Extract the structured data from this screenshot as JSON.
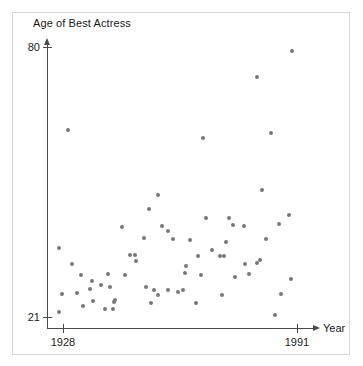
{
  "chart_data": {
    "type": "scatter",
    "title": "Age of Best Actress",
    "xlabel": "Year",
    "ylabel": "Age of Best Actress",
    "xlim": [
      1928,
      1991
    ],
    "ylim": [
      21,
      80
    ],
    "xticks": [
      1928,
      1991
    ],
    "yticks": [
      21,
      80
    ],
    "xtick_labels": [
      "1928",
      "1991"
    ],
    "ytick_labels": [
      "21",
      "80"
    ],
    "grid": false,
    "legend": null,
    "point_color": "#78787a",
    "axis_color": "#4a4a4a",
    "series": [
      {
        "name": "Best Actress age by year",
        "points": [
          [
            1929,
            62
          ],
          [
            1930,
            36
          ],
          [
            1931,
            31
          ],
          [
            1932,
            39
          ],
          [
            1933,
            22
          ],
          [
            1934,
            28
          ],
          [
            1935,
            34
          ],
          [
            1936,
            33
          ],
          [
            1937,
            30
          ],
          [
            1938,
            26
          ],
          [
            1939,
            26
          ],
          [
            1940,
            29
          ],
          [
            1941,
            32
          ],
          [
            1942,
            30
          ],
          [
            1943,
            25
          ],
          [
            1944,
            25
          ],
          [
            1945,
            36
          ],
          [
            1946,
            31
          ],
          [
            1947,
            33
          ],
          [
            1948,
            38
          ],
          [
            1949,
            28
          ],
          [
            1950,
            34
          ],
          [
            1951,
            34
          ],
          [
            1952,
            28
          ],
          [
            1953,
            24
          ],
          [
            1954,
            47
          ],
          [
            1955,
            43
          ],
          [
            1956,
            35
          ],
          [
            1957,
            52
          ],
          [
            1958,
            31
          ],
          [
            1959,
            33
          ],
          [
            1960,
            30
          ],
          [
            1961,
            41
          ],
          [
            1962,
            40
          ],
          [
            1963,
            33
          ],
          [
            1964,
            31
          ],
          [
            1965,
            25
          ],
          [
            1966,
            35
          ],
          [
            1967,
            42
          ],
          [
            1968,
            34
          ],
          [
            1969,
            34
          ],
          [
            1970,
            34
          ],
          [
            1971,
            33
          ],
          [
            1972,
            45
          ],
          [
            1973,
            25
          ],
          [
            1974,
            36
          ],
          [
            1975,
            35
          ],
          [
            1976,
            35
          ],
          [
            1977,
            30
          ],
          [
            1978,
            62
          ],
          [
            1979,
            41
          ],
          [
            1980,
            44
          ],
          [
            1981,
            43
          ],
          [
            1982,
            39
          ],
          [
            1983,
            34
          ],
          [
            1984,
            37
          ],
          [
            1985,
            35
          ],
          [
            1986,
            38
          ],
          [
            1987,
            33
          ],
          [
            1988,
            50
          ],
          [
            1989,
            29
          ],
          [
            1990,
            76
          ],
          [
            1991,
            80
          ],
          [
            1992,
            62
          ],
          [
            1993,
            38
          ],
          [
            1994,
            30
          ],
          [
            1995,
            22
          ],
          [
            1996,
            43
          ],
          [
            1997,
            41
          ],
          [
            1998,
            35
          ],
          [
            1999,
            33
          ]
        ]
      }
    ],
    "pixel_points": [
      [
        68,
        130
      ],
      [
        59,
        248
      ],
      [
        72,
        264
      ],
      [
        59,
        312
      ],
      [
        81,
        275
      ],
      [
        92,
        281
      ],
      [
        62,
        294
      ],
      [
        77,
        293
      ],
      [
        90,
        289
      ],
      [
        93,
        301
      ],
      [
        83,
        306
      ],
      [
        101,
        285
      ],
      [
        108,
        274
      ],
      [
        110,
        287
      ],
      [
        115,
        300
      ],
      [
        105,
        309
      ],
      [
        113,
        309
      ],
      [
        114,
        302
      ],
      [
        122,
        227
      ],
      [
        125,
        275
      ],
      [
        130,
        255
      ],
      [
        135,
        255
      ],
      [
        136,
        261
      ],
      [
        144,
        238
      ],
      [
        146,
        287
      ],
      [
        149,
        209
      ],
      [
        151,
        303
      ],
      [
        154,
        290
      ],
      [
        158,
        195
      ],
      [
        158,
        295
      ],
      [
        162,
        226
      ],
      [
        168,
        231
      ],
      [
        168,
        290
      ],
      [
        173,
        239
      ],
      [
        178,
        292
      ],
      [
        183,
        290
      ],
      [
        185,
        273
      ],
      [
        186,
        266
      ],
      [
        190,
        240
      ],
      [
        196,
        303
      ],
      [
        198,
        256
      ],
      [
        201,
        275
      ],
      [
        203,
        138
      ],
      [
        206,
        218
      ],
      [
        212,
        250
      ],
      [
        220,
        256
      ],
      [
        222,
        295
      ],
      [
        224,
        256
      ],
      [
        226,
        242
      ],
      [
        229,
        218
      ],
      [
        233,
        225
      ],
      [
        235,
        277
      ],
      [
        244,
        226
      ],
      [
        245,
        264
      ],
      [
        249,
        274
      ],
      [
        257,
        263
      ],
      [
        257,
        77
      ],
      [
        260,
        260
      ],
      [
        262,
        190
      ],
      [
        266,
        239
      ],
      [
        271,
        133
      ],
      [
        275,
        315
      ],
      [
        279,
        224
      ],
      [
        281,
        294
      ],
      [
        289,
        215
      ],
      [
        291,
        279
      ],
      [
        292,
        51
      ]
    ],
    "point_count": 68
  },
  "axes": {
    "title": "Age of Best Actress",
    "y_top_label": "80",
    "y_bottom_label": "21",
    "x_left_label": "1928",
    "x_right_label": "1991",
    "x_axis_name": "Year"
  }
}
